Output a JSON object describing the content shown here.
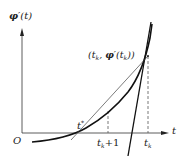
{
  "diagram": {
    "y_axis_label": "φ'(t)",
    "x_axis_label": "t",
    "origin_label": "O",
    "point_label": "(t_k, φ'(t_k))",
    "point_label_parts": {
      "open": "(",
      "tk": "t",
      "tk_sub": "k",
      "comma": ", ",
      "phi": "φ",
      "prime": "′",
      "paren_open": "(",
      "arg": "t",
      "arg_sub": "k",
      "close": "))"
    },
    "tick_labels": [
      {
        "id": "t_k_plus_1",
        "base": "t",
        "sub": "k",
        "suffix": "+1"
      },
      {
        "id": "t_k",
        "base": "t",
        "sub": "k",
        "suffix": ""
      }
    ],
    "root_label": {
      "base": "t",
      "sup": "*"
    },
    "colors": {
      "stroke": "#1a1a1a",
      "thin_stroke": "#444444",
      "dashed": "#555555",
      "background": "#ffffff"
    }
  }
}
